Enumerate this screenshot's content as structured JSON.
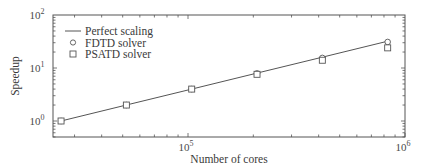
{
  "chart_data": {
    "type": "line",
    "title": "",
    "xlabel": "Number of cores",
    "ylabel": "Speedup",
    "xscale": "log",
    "yscale": "log",
    "xlim": [
      20000,
      1000000
    ],
    "ylim": [
      0.5,
      100
    ],
    "grid": false,
    "legend_position": "upper left",
    "x_tick_labels": [
      {
        "value": 100000,
        "base": "10",
        "exp": "5"
      },
      {
        "value": 1000000,
        "base": "10",
        "exp": "6"
      }
    ],
    "y_tick_labels": [
      {
        "value": 1,
        "base": "10",
        "exp": "0"
      },
      {
        "value": 10,
        "base": "10",
        "exp": "1"
      },
      {
        "value": 100,
        "base": "10",
        "exp": "2"
      }
    ],
    "x": [
      26000,
      52000,
      104000,
      208000,
      416000,
      832000
    ],
    "series": [
      {
        "name": "Perfect scaling",
        "style": "line",
        "values": [
          1,
          2,
          4,
          8,
          16,
          32
        ]
      },
      {
        "name": "FDTD solver",
        "style": "circle",
        "values": [
          1,
          2,
          4,
          7.9,
          15.5,
          31
        ]
      },
      {
        "name": "PSATD solver",
        "style": "square",
        "values": [
          1,
          2,
          4,
          7.6,
          14,
          24
        ]
      }
    ]
  },
  "legend": {
    "items": [
      {
        "label": "Perfect scaling",
        "marker": "line"
      },
      {
        "label": "FDTD solver",
        "marker": "circle"
      },
      {
        "label": "PSATD solver",
        "marker": "square"
      }
    ]
  },
  "colors": {
    "ink": "#555555",
    "text": "#3a3a3a",
    "background": "#ffffff"
  }
}
